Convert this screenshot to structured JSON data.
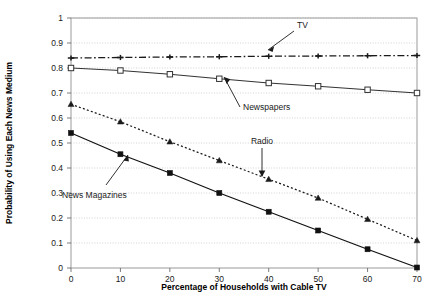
{
  "chart_data": {
    "type": "line",
    "title": "",
    "xlabel": "Percentage of Households with Cable TV",
    "ylabel": "Probability of Using Each News Medium",
    "x": [
      0,
      10,
      20,
      30,
      40,
      50,
      60,
      70
    ],
    "xlim": [
      0,
      70
    ],
    "ylim": [
      0,
      1
    ],
    "xticks": [
      "0",
      "10",
      "20",
      "30",
      "40",
      "50",
      "60",
      "70"
    ],
    "yticks": [
      "0",
      "0.1",
      "0.2",
      "0.3",
      "0.4",
      "0.5",
      "0.6",
      "0.7",
      "0.8",
      "0.9",
      "1"
    ],
    "grid": "horizontal-dotted",
    "legend": "none-inline-annotations",
    "series": [
      {
        "name": "TV",
        "values": [
          0.84,
          0.842,
          0.844,
          0.845,
          0.847,
          0.848,
          0.849,
          0.85
        ],
        "line_style": "dash-dot",
        "marker": "cross",
        "color": "#1a1a1a"
      },
      {
        "name": "Newspapers",
        "values": [
          0.8,
          0.79,
          0.775,
          0.757,
          0.74,
          0.727,
          0.713,
          0.7
        ],
        "line_style": "solid",
        "marker": "open-square",
        "color": "#333333"
      },
      {
        "name": "Radio",
        "values": [
          0.655,
          0.585,
          0.505,
          0.43,
          0.355,
          0.28,
          0.195,
          0.11
        ],
        "line_style": "dotted",
        "marker": "filled-triangle",
        "color": "#1a1a1a"
      },
      {
        "name": "News Magazines",
        "values": [
          0.54,
          0.455,
          0.38,
          0.3,
          0.225,
          0.15,
          0.075,
          0.002
        ],
        "line_style": "solid",
        "marker": "filled-square",
        "color": "#111111"
      }
    ],
    "annotations": [
      {
        "text": "TV",
        "kind": "arrow-down-left"
      },
      {
        "text": "Newspapers",
        "kind": "leader-up-right"
      },
      {
        "text": "Radio",
        "kind": "arrow-down"
      },
      {
        "text": "News Magazines",
        "kind": "leader-up-right"
      }
    ]
  },
  "axes": {
    "x_title": "Percentage of Households with Cable TV",
    "y_title": "Probability of Using Each News Medium"
  }
}
